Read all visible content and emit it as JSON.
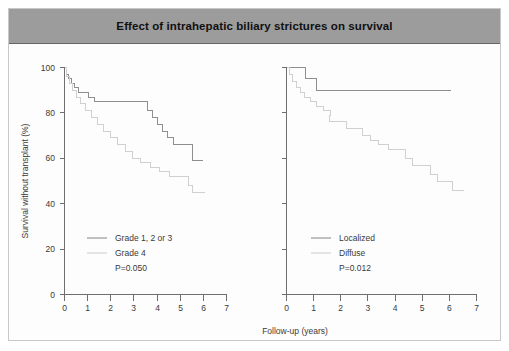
{
  "figure": {
    "title": "Effect of intrahepatic biliary strictures on survival",
    "title_bar_color": "#9c9c9c",
    "background_color": "#fdfdfd",
    "border_color": "#c8c8c8"
  },
  "axes": {
    "y_label": "Survival without transplant (%)",
    "x_label": "Follow-up (years)",
    "y_ticks": [
      "0",
      "20",
      "40",
      "60",
      "80",
      "100"
    ],
    "x_ticks": [
      "0",
      "1",
      "2",
      "3",
      "4",
      "5",
      "6",
      "7"
    ]
  },
  "chart_data": {
    "type": "line",
    "title": "Effect of intrahepatic biliary strictures on survival",
    "subtitle": "",
    "xlabel": "Follow-up (years)",
    "ylabel": "Survival without transplant (%)",
    "xlim": [
      0,
      7
    ],
    "ylim": [
      0,
      100
    ],
    "grid": false,
    "legend_position": "inside-lower-left",
    "panels": [
      {
        "id": "left-panel",
        "annotation": "P=0.050",
        "p_value": "P=0.050",
        "series": [
          {
            "name": "Grade 1, 2 or 3",
            "color": "#8f8f8f",
            "step": "post",
            "points": [
              [
                0.0,
                100
              ],
              [
                0.08,
                97
              ],
              [
                0.18,
                95
              ],
              [
                0.3,
                93
              ],
              [
                0.45,
                91
              ],
              [
                0.62,
                89
              ],
              [
                0.85,
                89
              ],
              [
                1.05,
                87
              ],
              [
                1.3,
                85
              ],
              [
                3.4,
                85
              ],
              [
                3.6,
                81
              ],
              [
                3.8,
                78
              ],
              [
                4.0,
                75
              ],
              [
                4.25,
                72
              ],
              [
                4.45,
                69
              ],
              [
                4.7,
                66
              ],
              [
                5.3,
                66
              ],
              [
                5.55,
                62
              ],
              [
                5.55,
                59
              ],
              [
                6.0,
                59
              ]
            ]
          },
          {
            "name": "Grade 4",
            "color": "#d0d0d0",
            "step": "post",
            "points": [
              [
                0.0,
                100
              ],
              [
                0.1,
                96
              ],
              [
                0.22,
                93
              ],
              [
                0.35,
                90
              ],
              [
                0.5,
                87
              ],
              [
                0.68,
                84
              ],
              [
                0.9,
                81
              ],
              [
                1.15,
                78
              ],
              [
                1.42,
                75
              ],
              [
                1.7,
                72
              ],
              [
                2.0,
                69
              ],
              [
                2.3,
                66
              ],
              [
                2.62,
                63
              ],
              [
                2.95,
                60
              ],
              [
                3.3,
                58
              ],
              [
                3.7,
                56
              ],
              [
                4.1,
                54
              ],
              [
                4.55,
                52
              ],
              [
                5.1,
                52
              ],
              [
                5.35,
                48
              ],
              [
                5.55,
                45
              ],
              [
                6.05,
                45
              ]
            ]
          }
        ]
      },
      {
        "id": "right-panel",
        "annotation": "P=0.012",
        "p_value": "P=0.012",
        "series": [
          {
            "name": "Localized",
            "color": "#8f8f8f",
            "step": "post",
            "points": [
              [
                0.0,
                100
              ],
              [
                0.55,
                100
              ],
              [
                0.7,
                95
              ],
              [
                0.95,
                95
              ],
              [
                1.1,
                90
              ],
              [
                6.05,
                90
              ]
            ]
          },
          {
            "name": "Diffuse",
            "color": "#d0d0d0",
            "step": "post",
            "points": [
              [
                0.0,
                100
              ],
              [
                0.1,
                97
              ],
              [
                0.22,
                94
              ],
              [
                0.35,
                91
              ],
              [
                0.5,
                89
              ],
              [
                0.68,
                87
              ],
              [
                0.88,
                85
              ],
              [
                1.1,
                83
              ],
              [
                1.35,
                81
              ],
              [
                1.62,
                79
              ],
              [
                1.6,
                76
              ],
              [
                1.95,
                76
              ],
              [
                2.2,
                73
              ],
              [
                2.55,
                73
              ],
              [
                2.8,
                70
              ],
              [
                3.1,
                68
              ],
              [
                3.4,
                66
              ],
              [
                3.75,
                64
              ],
              [
                4.15,
                64
              ],
              [
                4.4,
                60
              ],
              [
                4.65,
                57
              ],
              [
                5.0,
                57
              ],
              [
                5.3,
                53
              ],
              [
                5.55,
                50
              ],
              [
                5.9,
                50
              ],
              [
                6.1,
                46
              ],
              [
                6.55,
                46
              ]
            ]
          }
        ]
      }
    ]
  },
  "legends": {
    "left": {
      "items": [
        {
          "label": "Grade 1, 2 or 3",
          "color": "#8f8f8f"
        },
        {
          "label": "Grade 4",
          "color": "#d0d0d0"
        }
      ],
      "p_value": "P=0.050"
    },
    "right": {
      "items": [
        {
          "label": "Localized",
          "color": "#8f8f8f"
        },
        {
          "label": "Diffuse",
          "color": "#d0d0d0"
        }
      ],
      "p_value": "P=0.012"
    }
  }
}
